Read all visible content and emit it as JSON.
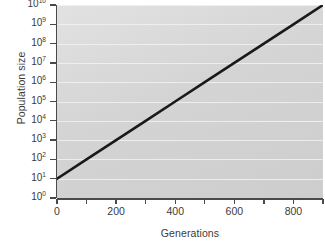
{
  "chart_data": {
    "type": "line",
    "title": "",
    "xlabel": "Generations",
    "ylabel": "Population size",
    "xlim": [
      0,
      900
    ],
    "ylim": [
      1,
      10000000000
    ],
    "yscale": "log",
    "grid": true,
    "legend": null,
    "xticks": [
      0,
      100,
      200,
      300,
      400,
      500,
      600,
      700,
      800,
      900
    ],
    "xtick_labels": [
      "0",
      "",
      "200",
      "",
      "400",
      "",
      "600",
      "",
      "800",
      ""
    ],
    "ytick_exponents": [
      0,
      1,
      2,
      3,
      4,
      5,
      6,
      7,
      8,
      9,
      10
    ],
    "ytick_base": "10",
    "ytick_labels": [
      "10^0",
      "10^1",
      "10^2",
      "10^3",
      "10^4",
      "10^5",
      "10^6",
      "10^7",
      "10^8",
      "10^9",
      "10^10"
    ],
    "series": [
      {
        "name": "population growth",
        "color": "#1a1a1a",
        "linewidth": 2.6,
        "x": [
          0,
          100,
          200,
          300,
          400,
          500,
          600,
          700,
          800,
          900
        ],
        "y": [
          10,
          100,
          1000,
          10000,
          100000,
          1000000,
          10000000,
          100000000,
          1000000000,
          10000000000
        ],
        "log_y": [
          1,
          2,
          3,
          4,
          5,
          6,
          7,
          8,
          9,
          10
        ]
      }
    ],
    "colors": {
      "plot_background_light": "#e2e2e2",
      "plot_background_dark": "#cdcdcd",
      "gridline": "#f2f2f2",
      "axis": "#4a4a4a",
      "text": "#3a3a3a",
      "line": "#1a1a1a",
      "page_background": "#ffffff"
    }
  }
}
